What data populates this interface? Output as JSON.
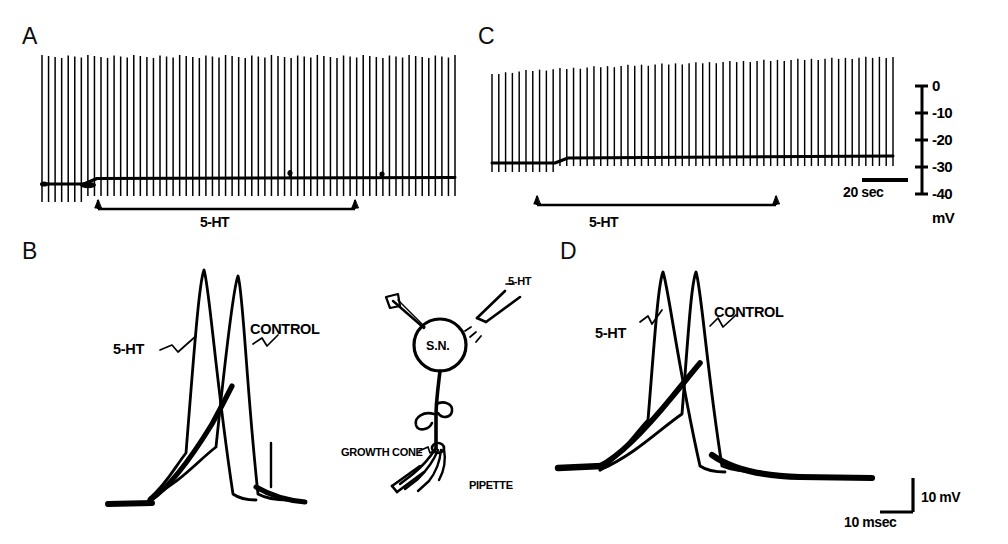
{
  "figure": {
    "background": "#ffffff",
    "ink": "#000000",
    "panels": [
      {
        "letter": "A",
        "kind": "spike-train-recording"
      },
      {
        "letter": "B",
        "kind": "action-potential-overlay"
      },
      {
        "letter": "C",
        "kind": "spike-train-recording"
      },
      {
        "letter": "D",
        "kind": "action-potential-overlay"
      }
    ]
  },
  "panel_a": {
    "letter": "A",
    "drug_bar_label": "5-HT",
    "n_spikes": 64,
    "baseline_step_mv": 3
  },
  "panel_b": {
    "letter": "B",
    "trace_labels": {
      "treated": "5-HT",
      "control": "CONTROL"
    }
  },
  "panel_c": {
    "letter": "C",
    "drug_bar_label": "5-HT",
    "n_spikes": 60,
    "time_scale_label": "20 sec"
  },
  "panel_d": {
    "letter": "D",
    "trace_labels": {
      "treated": "5-HT",
      "control": "CONTROL"
    },
    "scale_voltage_label": "10 mV",
    "scale_time_label": "10 msec"
  },
  "voltage_axis": {
    "unit_label": "mV",
    "ticks": [
      {
        "label": "0",
        "value": 0
      },
      {
        "label": "-10",
        "value": -10
      },
      {
        "label": "-20",
        "value": -20
      },
      {
        "label": "-30",
        "value": -30
      },
      {
        "label": "-40",
        "value": -40
      }
    ]
  },
  "diagram": {
    "soma_label": "S.N.",
    "drug_pipette_label": "5-HT",
    "growth_cone_label": "GROWTH CONE",
    "pipette_label": "PIPETTE"
  },
  "chart_data": {
    "type": "line",
    "title": "",
    "xlabel": "",
    "ylabel": "Membrane potential (mV)",
    "ylim": [
      -40,
      0
    ],
    "grid": false,
    "legend": "inline-annotations",
    "subplots": [
      {
        "id": "A",
        "description": "Intracellular recording from a serotonergic neuron soma; spike train with baseline depolarization during 5-HT application",
        "x_unit": "sec",
        "y_unit": "mV",
        "baseline_before_mv": -30,
        "baseline_during_mv": -27,
        "spike_peak_mv": 0,
        "spike_count": 64,
        "drug_onset_fraction": 0.1,
        "drug_offset_fraction": 0.74,
        "drug": "5-HT"
      },
      {
        "id": "C",
        "description": "Recording with progressive increase of spike amplitude and small baseline depolarization during 5-HT",
        "x_unit": "sec",
        "y_unit": "mV",
        "baseline_before_mv": -30,
        "baseline_during_mv": -28,
        "spike_peak_start_mv": -7,
        "spike_peak_end_mv": 1,
        "spike_count": 60,
        "drug_onset_fraction": 0.04,
        "drug_offset_fraction": 0.64,
        "time_scale_sec": 20,
        "drug": "5-HT"
      },
      {
        "id": "B",
        "description": "Superimposed action potentials: 5-HT (left, broadened) vs CONTROL (right)",
        "x_unit": "msec",
        "y_unit": "mV",
        "scale_voltage_mv": 10,
        "scale_time_msec": 10,
        "series": [
          {
            "name": "5-HT",
            "peak_relative_mv": 62,
            "half_width_msec": 7.5
          },
          {
            "name": "CONTROL",
            "peak_relative_mv": 58,
            "half_width_msec": 4.5
          }
        ]
      },
      {
        "id": "D",
        "description": "Superimposed action potentials from growth cone: 5-HT (left) vs CONTROL (right)",
        "x_unit": "msec",
        "y_unit": "mV",
        "scale_voltage_mv": 10,
        "scale_time_msec": 10,
        "series": [
          {
            "name": "5-HT",
            "peak_relative_mv": 60,
            "half_width_msec": 8.0
          },
          {
            "name": "CONTROL",
            "peak_relative_mv": 60,
            "half_width_msec": 5.0
          }
        ]
      }
    ]
  }
}
